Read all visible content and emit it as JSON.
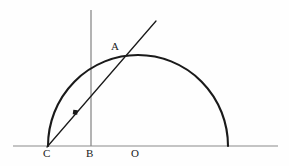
{
  "figure": {
    "background_color": "#fefefe",
    "stroke_color": "#1a1a1a",
    "thin_stroke_color": "#808080",
    "width": 289,
    "height": 166,
    "labels": [
      {
        "name": "A",
        "text": "A",
        "x": 111,
        "y": 41,
        "anchor": "arc-chord-intersection"
      },
      {
        "name": "C",
        "text": "C",
        "x": 43,
        "y": 148,
        "anchor": "semicircle-left-endpoint"
      },
      {
        "name": "B",
        "text": "B",
        "x": 86,
        "y": 148,
        "anchor": "vertical-line-foot"
      },
      {
        "name": "O",
        "text": "O",
        "x": 131,
        "y": 148,
        "anchor": "semicircle-center"
      }
    ],
    "geometry": {
      "baseline": {
        "name": "baseline",
        "x1": 13,
        "y1": 146,
        "x2": 278,
        "y2": 146
      },
      "semicircle": {
        "name": "semicircle-arc",
        "center_x": 138,
        "center_y": 146,
        "radius_x": 90,
        "radius_y": 91,
        "left_endpoint_x": 48,
        "right_endpoint_x": 228,
        "apex_y": 55
      },
      "vertical_line": {
        "name": "vertical-line",
        "x": 91,
        "y_top": 10,
        "y_bottom": 146
      },
      "chord_line": {
        "name": "chord-line",
        "x1": 47,
        "y1": 147,
        "x2": 156,
        "y2": 21
      },
      "marker_dot": {
        "name": "chord-marker-dot",
        "x": 75,
        "y": 112,
        "size": 4
      },
      "intersection_A": {
        "name": "point-a",
        "x": 122,
        "y": 57
      }
    }
  }
}
